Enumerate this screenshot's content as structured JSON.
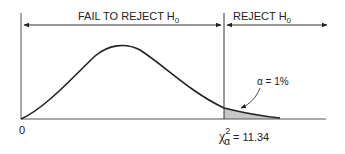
{
  "diagram": {
    "regions": {
      "fail_to_reject": {
        "label": "FAIL TO REJECT H",
        "subscript": "0"
      },
      "reject": {
        "label": "REJECT H",
        "subscript": "0"
      }
    },
    "origin_label": "0",
    "alpha_label": "α = 1%",
    "critical_value": {
      "symbol": "χ",
      "superscript": "2",
      "subscript": "α",
      "text": "= 11.34",
      "value": 11.34
    },
    "colors": {
      "line": "#222222",
      "axis": "#555555",
      "shade": "#c8c8c8"
    }
  }
}
